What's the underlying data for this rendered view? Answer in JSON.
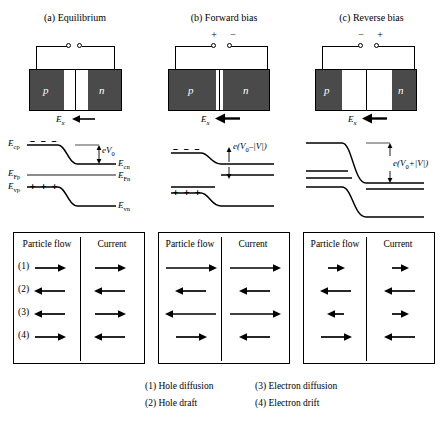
{
  "figure": {
    "panels": [
      {
        "id": "a",
        "title": "(a) Equilibrium",
        "left_polarity": "",
        "right_polarity": "",
        "field_label": "E",
        "field_sub": "x",
        "p_label": "p",
        "n_label": "n",
        "depletion": "medium",
        "barrier_label": "eV",
        "barrier_sub": "0",
        "barrier_suffix": "",
        "negative_charges": "– – –",
        "positive_charges": "+ + +",
        "left_band_labels": [
          "E",
          "E",
          "E"
        ],
        "left_band_subs": [
          "cp",
          "Fp",
          "vp"
        ],
        "right_band_labels": [
          "E",
          "E",
          "E"
        ],
        "right_band_subs": [
          "cn",
          "Fn",
          "vn"
        ],
        "table": {
          "col_particle": "Particle flow",
          "col_current": "Current",
          "rows": [
            {
              "num": "(1)",
              "particle_dir": "right",
              "particle_len": "medium",
              "current_dir": "right",
              "current_len": "medium"
            },
            {
              "num": "(2)",
              "particle_dir": "left",
              "particle_len": "medium",
              "current_dir": "left",
              "current_len": "medium"
            },
            {
              "num": "(3)",
              "particle_dir": "left",
              "particle_len": "medium",
              "current_dir": "right",
              "current_len": "medium"
            },
            {
              "num": "(4)",
              "particle_dir": "right",
              "particle_len": "medium",
              "current_dir": "left",
              "current_len": "medium"
            }
          ]
        }
      },
      {
        "id": "b",
        "title": "(b) Forward bias",
        "left_polarity": "+",
        "right_polarity": "−",
        "field_label": "E",
        "field_sub": "x",
        "p_label": "p",
        "n_label": "n",
        "depletion": "narrow",
        "barrier_label": "e(V",
        "barrier_sub": "0",
        "barrier_suffix": "–|V|)",
        "negative_charges": "– – –",
        "positive_charges": "+ + +",
        "left_band_labels": [],
        "left_band_subs": [],
        "right_band_labels": [],
        "right_band_subs": [],
        "table": {
          "col_particle": "Particle flow",
          "col_current": "Current",
          "rows": [
            {
              "num": "",
              "particle_dir": "right",
              "particle_len": "long",
              "current_dir": "right",
              "current_len": "long"
            },
            {
              "num": "",
              "particle_dir": "left",
              "particle_len": "medium",
              "current_dir": "left",
              "current_len": "medium"
            },
            {
              "num": "",
              "particle_dir": "left",
              "particle_len": "long",
              "current_dir": "right",
              "current_len": "long"
            },
            {
              "num": "",
              "particle_dir": "right",
              "particle_len": "medium",
              "current_dir": "left",
              "current_len": "medium"
            }
          ]
        }
      },
      {
        "id": "c",
        "title": "(c) Reverse bias",
        "left_polarity": "−",
        "right_polarity": "+",
        "field_label": "E",
        "field_sub": "x",
        "p_label": "p",
        "n_label": "n",
        "depletion": "wide",
        "barrier_label": "e(V",
        "barrier_sub": "0",
        "barrier_suffix": "+|V|)",
        "negative_charges": "",
        "positive_charges": "",
        "left_band_labels": [],
        "left_band_subs": [],
        "right_band_labels": [],
        "right_band_subs": [],
        "table": {
          "col_particle": "Particle flow",
          "col_current": "Current",
          "rows": [
            {
              "num": "",
              "particle_dir": "right",
              "particle_len": "short",
              "current_dir": "right",
              "current_len": "short"
            },
            {
              "num": "",
              "particle_dir": "left",
              "particle_len": "medium",
              "current_dir": "left",
              "current_len": "medium"
            },
            {
              "num": "",
              "particle_dir": "left",
              "particle_len": "short",
              "current_dir": "right",
              "current_len": "short"
            },
            {
              "num": "",
              "particle_dir": "right",
              "particle_len": "medium",
              "current_dir": "left",
              "current_len": "medium"
            }
          ]
        }
      }
    ],
    "legend": {
      "item1": "(1) Hole diffusion",
      "item2": "(2) Hole draft",
      "item3": "(3) Electron diffusion",
      "item4": "(4) Electron drift"
    },
    "colors": {
      "semiconductor": "#4a4a4a",
      "line": "#000000",
      "background": "#ffffff"
    }
  }
}
